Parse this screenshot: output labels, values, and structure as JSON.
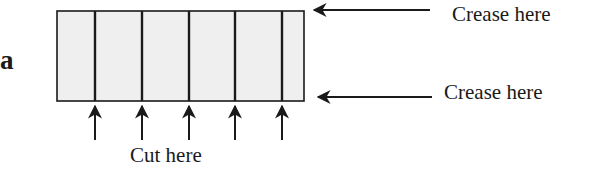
{
  "figure": {
    "panel_label": "a",
    "strip": {
      "fill": "#efefef",
      "stroke": "#1a1a1a",
      "segments": 6,
      "cut_line_count": 5
    },
    "labels": {
      "crease_top": "Crease here",
      "crease_bottom": "Crease here",
      "cut": "Cut here"
    },
    "arrows": {
      "crease_top": "arrow-left",
      "crease_bottom": "arrow-left",
      "cut": "arrow-up"
    }
  }
}
